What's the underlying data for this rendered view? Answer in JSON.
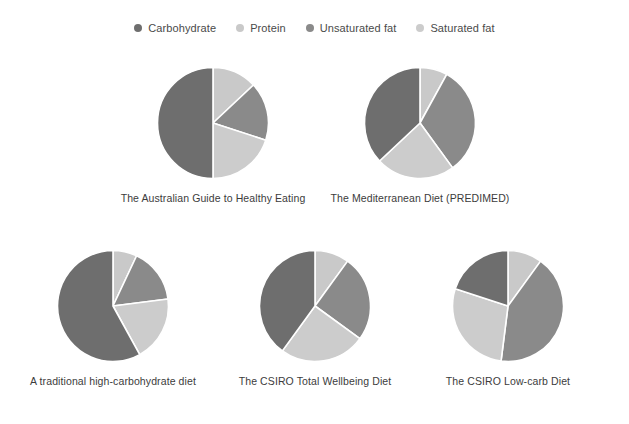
{
  "legend": {
    "items": [
      {
        "label": "Carbohydrate",
        "color": "#6e6e6e",
        "marker": "legend-dot-icon"
      },
      {
        "label": "Protein",
        "color": "#c9c9c9",
        "marker": "legend-dot-icon"
      },
      {
        "label": "Unsaturated fat",
        "color": "#8a8a8a",
        "marker": "legend-dot-icon"
      },
      {
        "label": "Saturated fat",
        "color": "#cccccc",
        "marker": "legend-dot-icon"
      }
    ]
  },
  "colors": {
    "carbohydrate": "#6e6e6e",
    "protein": "#c9c9c9",
    "unsaturated_fat": "#8a8a8a",
    "saturated_fat": "#cccccc",
    "separator": "#ffffff",
    "background": "#ffffff",
    "text": "#3c3c3c"
  },
  "chart_data": {
    "type": "pie",
    "title": "",
    "legend_position": "top",
    "series_names": [
      "Carbohydrate",
      "Protein",
      "Unsaturated fat",
      "Saturated fat"
    ],
    "series_colors": [
      "#6e6e6e",
      "#c9c9c9",
      "#8a8a8a",
      "#cccccc"
    ],
    "units": "percent of energy",
    "charts": [
      {
        "title": "The Australian Guide to Healthy Eating",
        "categories": [
          "Protein",
          "Unsaturated fat",
          "Saturated fat",
          "Carbohydrate"
        ],
        "values": [
          13,
          17,
          20,
          50
        ],
        "colors": [
          "#c9c9c9",
          "#8a8a8a",
          "#cccccc",
          "#6e6e6e"
        ],
        "start_angle": 0
      },
      {
        "title": "The Mediterranean Diet (PREDIMED)",
        "categories": [
          "Protein",
          "Unsaturated fat",
          "Saturated fat",
          "Carbohydrate"
        ],
        "values": [
          8,
          32,
          23,
          37
        ],
        "colors": [
          "#c9c9c9",
          "#8a8a8a",
          "#cccccc",
          "#6e6e6e"
        ],
        "start_angle": 0
      },
      {
        "title": "A traditional high-carbohydrate diet",
        "categories": [
          "Protein",
          "Unsaturated fat",
          "Saturated fat",
          "Carbohydrate"
        ],
        "values": [
          7,
          16,
          19,
          58
        ],
        "colors": [
          "#c9c9c9",
          "#8a8a8a",
          "#cccccc",
          "#6e6e6e"
        ],
        "start_angle": 0
      },
      {
        "title": "The CSIRO Total Wellbeing Diet",
        "categories": [
          "Protein",
          "Unsaturated fat",
          "Saturated fat",
          "Carbohydrate"
        ],
        "values": [
          10,
          25,
          25,
          40
        ],
        "colors": [
          "#c9c9c9",
          "#8a8a8a",
          "#cccccc",
          "#6e6e6e"
        ],
        "start_angle": 0
      },
      {
        "title": "The CSIRO Low-carb Diet",
        "categories": [
          "Protein",
          "Unsaturated fat",
          "Saturated fat",
          "Carbohydrate"
        ],
        "values": [
          10,
          42,
          28,
          20
        ],
        "colors": [
          "#c9c9c9",
          "#8a8a8a",
          "#cccccc",
          "#6e6e6e"
        ],
        "start_angle": 0
      }
    ]
  }
}
